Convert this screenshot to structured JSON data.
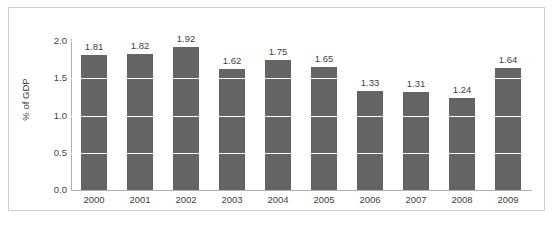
{
  "chart_data": {
    "type": "bar",
    "title": "",
    "xlabel": "",
    "ylabel": "% of GDP",
    "categories": [
      "2000",
      "2001",
      "2002",
      "2003",
      "2004",
      "2005",
      "2006",
      "2007",
      "2008",
      "2009"
    ],
    "values": [
      1.81,
      1.82,
      1.92,
      1.62,
      1.75,
      1.65,
      1.33,
      1.31,
      1.24,
      1.64
    ],
    "value_labels": [
      "1.81",
      "1.82",
      "1.92",
      "1.62",
      "1.75",
      "1.65",
      "1.33",
      "1.31",
      "1.24",
      "1.64"
    ],
    "ylim": [
      0.0,
      2.0
    ],
    "ytick_labels": [
      "0.0",
      "0.5",
      "1.0",
      "1.5",
      "2.0"
    ],
    "ytick_values": [
      0.0,
      0.5,
      1.0,
      1.5,
      2.0
    ],
    "grid": true,
    "grid_axis": "y",
    "legend": false,
    "legend_position": "none",
    "series": [
      {
        "name": "% of GDP",
        "color": "#646464",
        "values": [
          1.81,
          1.82,
          1.92,
          1.62,
          1.75,
          1.65,
          1.33,
          1.31,
          1.24,
          1.64
        ]
      }
    ]
  },
  "colors": {
    "bar": "#646464",
    "gridline": "#e8e8e8",
    "gridline_over_bar": "#ffffff",
    "axis": "#b0b0b0",
    "frame_border": "#cfcfcf",
    "text": "#3f3f3f",
    "background": "#ffffff"
  }
}
